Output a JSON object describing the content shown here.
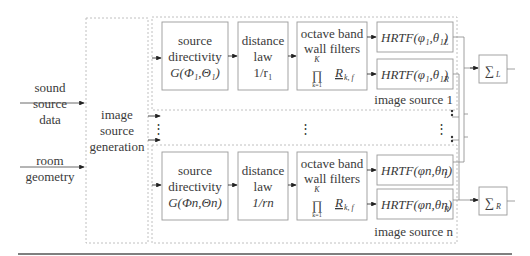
{
  "inputs": {
    "sound_source_data": [
      "sound",
      "source",
      "data"
    ],
    "room_geometry": [
      "room",
      "geometry"
    ]
  },
  "generator": {
    "label": [
      "image",
      "source",
      "generation"
    ]
  },
  "image_source_1": {
    "group_label": "image source 1",
    "directivity": [
      "source",
      "directivity",
      "G(Φ₁,Θ₁)"
    ],
    "distance": [
      "distance",
      "law",
      "1/r₁"
    ],
    "wall_filters": [
      "octave band",
      "wall filters"
    ],
    "product": {
      "symbol": "∏",
      "upper": "K",
      "lower": "k=1",
      "term": "R",
      "subscript": "k, f"
    },
    "hrtf_left": "HRTF(φ₁,θ₁)",
    "hrtf_left_sub": "L",
    "hrtf_right": "HRTF(φ₁,θ₁)",
    "hrtf_right_sub": "R"
  },
  "image_source_n": {
    "group_label": "image source n",
    "directivity": [
      "source",
      "directivity",
      "G(Φn,Θn)"
    ],
    "distance": [
      "distance",
      "law",
      "1/rn"
    ],
    "wall_filters": [
      "octave band",
      "wall filters"
    ],
    "product": {
      "symbol": "∏",
      "upper": "K",
      "lower": "k=1",
      "term": "R",
      "subscript": "k, f"
    },
    "hrtf_left": "HRTF(φn,θn)",
    "hrtf_left_sub": "L",
    "hrtf_right": "HRTF(φn,θn)",
    "hrtf_right_sub": "R"
  },
  "ellipsis": "⋮",
  "sum_left": {
    "symbol": "∑",
    "sub": "L"
  },
  "sum_right": {
    "symbol": "∑",
    "sub": "R"
  },
  "colors": {
    "box_stroke": "#9a9a9a",
    "dashed_stroke": "#b0b0b0",
    "arrow": "#222222",
    "rule": "#555555"
  }
}
